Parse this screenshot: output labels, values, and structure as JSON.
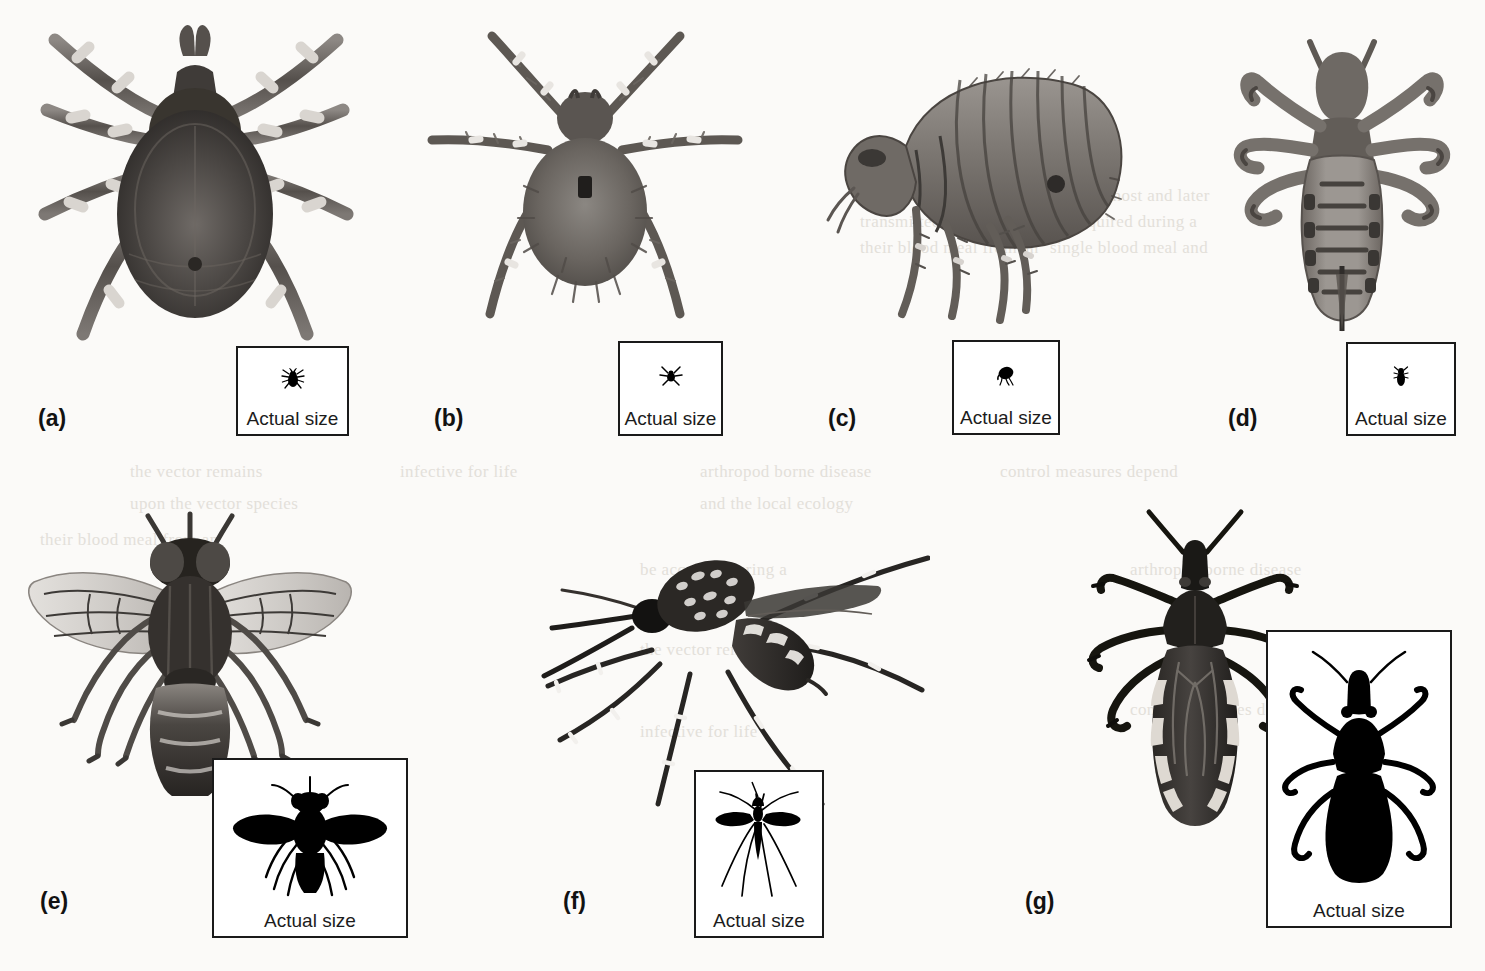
{
  "figure": {
    "background_color": "#fbfaf8",
    "ink_color": "#1a1a1a",
    "panel_count": 7
  },
  "insets": {
    "caption": "Actual size"
  },
  "panels": [
    {
      "id": "a",
      "label": "(a)",
      "specimen": "tick",
      "view": "dorsal",
      "silhouette": "tick-silhouette",
      "inset_caption": "Actual size"
    },
    {
      "id": "b",
      "label": "(b)",
      "specimen": "mite",
      "view": "dorsal",
      "silhouette": "mite-silhouette",
      "inset_caption": "Actual size"
    },
    {
      "id": "c",
      "label": "(c)",
      "specimen": "flea",
      "view": "lateral",
      "silhouette": "flea-silhouette",
      "inset_caption": "Actual size"
    },
    {
      "id": "d",
      "label": "(d)",
      "specimen": "louse",
      "view": "dorsal",
      "silhouette": "louse-silhouette",
      "inset_caption": "Actual size"
    },
    {
      "id": "e",
      "label": "(e)",
      "specimen": "tsetse-fly",
      "view": "dorsal",
      "silhouette": "fly-silhouette",
      "inset_caption": "Actual size"
    },
    {
      "id": "f",
      "label": "(f)",
      "specimen": "mosquito",
      "view": "lateral",
      "silhouette": "mosquito-silhouette",
      "inset_caption": "Actual size"
    },
    {
      "id": "g",
      "label": "(g)",
      "specimen": "triatomine-bug",
      "view": "dorsal",
      "silhouette": "triatomine-silhouette",
      "inset_caption": "Actual size"
    }
  ],
  "ghost_text": [
    "the same way that other",
    "transmitted by the bite of",
    "their blood meal from an",
    "infected host and later",
    "be acquired during a",
    "single blood meal and",
    "the vector remains",
    "infective for life",
    "arthropod borne disease",
    "control measures depend",
    "upon the vector species",
    "and the local ecology"
  ]
}
